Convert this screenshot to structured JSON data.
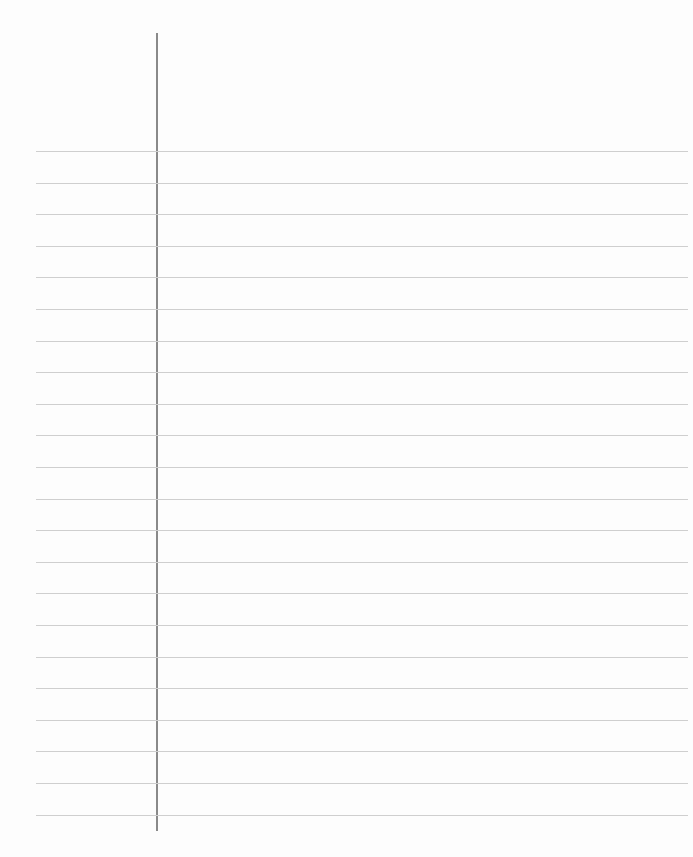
{
  "page": {
    "type": "lined-notebook-paper",
    "background_color": "#fdfdfd",
    "rule_color": "#cfcfcf",
    "margin_line_color": "#8a8a8a",
    "rule_count": 22,
    "first_rule_y": 151,
    "rule_spacing": 31.6,
    "margin_line_x": 156,
    "text_content": ""
  }
}
